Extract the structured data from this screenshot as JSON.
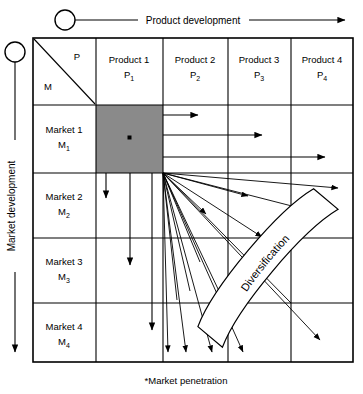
{
  "diagram": {
    "top_axis": {
      "label": "Product development",
      "marker": "circle-marker",
      "direction": "right"
    },
    "left_axis": {
      "label": "Market development",
      "marker": "circle-marker",
      "direction": "down"
    },
    "corner_cell": {
      "product_letter": "P",
      "market_letter": "M"
    },
    "columns": [
      {
        "label": "Product 1",
        "code": "P",
        "subscript": "1"
      },
      {
        "label": "Product 2",
        "code": "P",
        "subscript": "2"
      },
      {
        "label": "Product 3",
        "code": "P",
        "subscript": "3"
      },
      {
        "label": "Product 4",
        "code": "P",
        "subscript": "4"
      }
    ],
    "rows": [
      {
        "label": "Market 1",
        "code": "M",
        "subscript": "1"
      },
      {
        "label": "Market 2",
        "code": "M",
        "subscript": "2"
      },
      {
        "label": "Market 3",
        "code": "M",
        "subscript": "3"
      },
      {
        "label": "Market 4",
        "code": "M",
        "subscript": "4"
      }
    ],
    "highlight_cell": {
      "row": "Market 1",
      "column": "Product 1",
      "fill_color": "#8a8a8a",
      "dot_color": "#000000",
      "meaning": "market penetration"
    },
    "banner": {
      "label": "Diversification",
      "fill_color": "#ffffff",
      "stroke_color": "#000000"
    },
    "caption": "*Market penetration",
    "colors": {
      "line": "#000000",
      "background": "#ffffff",
      "highlight": "#8a8a8a"
    }
  }
}
